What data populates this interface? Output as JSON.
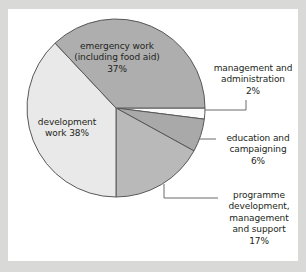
{
  "figure": {
    "background_color": "#d9d9d7",
    "card_color": "#ffffff",
    "text_color": "#231f20"
  },
  "chart_data": {
    "type": "pie",
    "title": "",
    "subtitle": "",
    "xlabel": "",
    "ylabel": "",
    "legend_position": "none",
    "grid": false,
    "units": "percent",
    "total": 100,
    "start_angle_deg": 0,
    "direction": "clockwise",
    "categories": [
      "management and administration",
      "education and campaigning",
      "programme development, management and support",
      "development work",
      "emergency work (including food aid)"
    ],
    "values": [
      2,
      6,
      17,
      38,
      37
    ],
    "slices": [
      {
        "id": "management",
        "name": "management and administration",
        "label_lines": "management and\nadministration\n2%",
        "value": 2,
        "value_text": "2%",
        "color": "#fbfbfb",
        "start_deg": 0,
        "end_deg": 7.2,
        "label_placement": "callout"
      },
      {
        "id": "education",
        "name": "education and campaigning",
        "label_lines": "education and\ncampaigning\n6%",
        "value": 6,
        "value_text": "6%",
        "color": "#a9a9a9",
        "start_deg": 7.2,
        "end_deg": 28.8,
        "label_placement": "callout"
      },
      {
        "id": "programme",
        "name": "programme development, management and support",
        "label_lines": "programme\ndevelopment,\nmanagement\nand support\n17%",
        "value": 17,
        "value_text": "17%",
        "color": "#b9b9b9",
        "start_deg": 28.8,
        "end_deg": 90,
        "label_placement": "callout"
      },
      {
        "id": "development",
        "name": "development work",
        "label_lines": "development\nwork 38%",
        "value": 38,
        "value_text": "38%",
        "color": "#e9e9e9",
        "start_deg": 90,
        "end_deg": 226.8,
        "label_placement": "inside"
      },
      {
        "id": "emergency",
        "name": "emergency work (including food aid)",
        "label_lines": "emergency work\n(including food aid)\n37%",
        "value": 37,
        "value_text": "37%",
        "color": "#aeaeae",
        "start_deg": 226.8,
        "end_deg": 360,
        "label_placement": "inside"
      }
    ],
    "geometry": {
      "center_x": 116,
      "center_y": 108,
      "radius": 89,
      "stroke_color": "#585858",
      "stroke_width": 1
    },
    "leader_lines": [
      {
        "id": "management-leader",
        "points": "205,110 246,110 246,100"
      },
      {
        "id": "education-leader",
        "points": "199,139 216,139"
      },
      {
        "id": "programme-leader",
        "points": "164,184 164,198 218,198"
      }
    ]
  }
}
